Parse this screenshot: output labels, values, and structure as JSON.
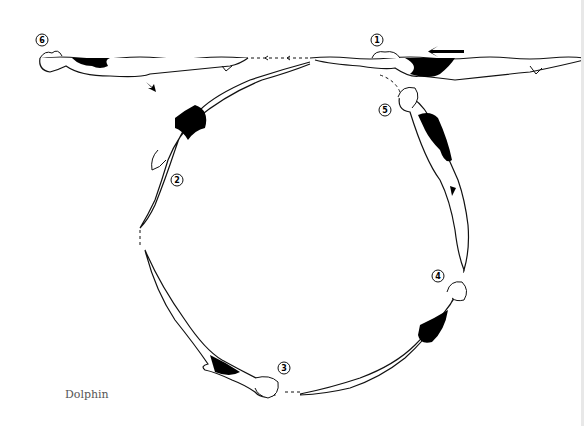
{
  "figure": {
    "caption": "Dolphin",
    "direction_arrow": "left",
    "path_shape": "circle",
    "positions": [
      {
        "number": "1",
        "label": "1",
        "description": "back layout on surface, moving left"
      },
      {
        "number": "2",
        "label": "2",
        "description": "head-first descent, arms extended"
      },
      {
        "number": "3",
        "label": "3",
        "description": "inverted at bottom of circle"
      },
      {
        "number": "4",
        "label": "4",
        "description": "arching upward, ascending"
      },
      {
        "number": "5",
        "label": "5",
        "description": "near vertical, approaching surface"
      },
      {
        "number": "6",
        "label": "6",
        "description": "back layout on surface, finish"
      }
    ],
    "colors": {
      "ink": "#111111",
      "suit": "#000000",
      "background": "#ffffff",
      "caption_text": "#555555"
    }
  }
}
